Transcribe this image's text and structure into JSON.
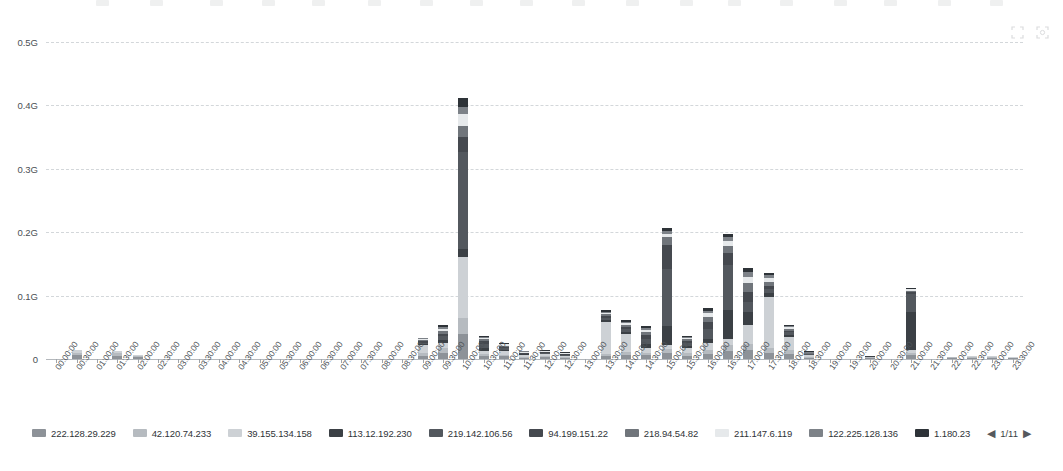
{
  "tools": [
    {
      "name": "restore-icon",
      "glyph": "restore"
    },
    {
      "name": "zoom-select-icon",
      "glyph": "zoom"
    }
  ],
  "legend": {
    "page_label": "1/11",
    "prev_label": "◀",
    "next_label": "▶",
    "items": [
      {
        "label": "222.128.29.229",
        "color": "#8d9298"
      },
      {
        "label": "42.120.74.233",
        "color": "#b6bbc0"
      },
      {
        "label": "39.155.134.158",
        "color": "#cdd1d5"
      },
      {
        "label": "113.12.192.230",
        "color": "#3b4045"
      },
      {
        "label": "219.142.106.56",
        "color": "#53585e"
      },
      {
        "label": "94.199.151.22",
        "color": "#45494f"
      },
      {
        "label": "218.94.54.82",
        "color": "#70757b"
      },
      {
        "label": "211.147.6.119",
        "color": "#e6e9eb"
      },
      {
        "label": "122.225.128.136",
        "color": "#7d8288"
      },
      {
        "label": "1.180.23",
        "color": "#2e3338"
      }
    ]
  },
  "top_strip": [
    {
      "label": "",
      "x": 96
    },
    {
      "label": "",
      "x": 150
    },
    {
      "label": "",
      "x": 210
    },
    {
      "label": "",
      "x": 262
    },
    {
      "label": "",
      "x": 312
    },
    {
      "label": "",
      "x": 368
    },
    {
      "label": "",
      "x": 420
    },
    {
      "label": "",
      "x": 470
    },
    {
      "label": "",
      "x": 520
    },
    {
      "label": "",
      "x": 572
    },
    {
      "label": "",
      "x": 626
    },
    {
      "label": "",
      "x": 680
    },
    {
      "label": "",
      "x": 728
    },
    {
      "label": "",
      "x": 780
    },
    {
      "label": "",
      "x": 834
    },
    {
      "label": "",
      "x": 884
    },
    {
      "label": "",
      "x": 938
    },
    {
      "label": "",
      "x": 990
    }
  ],
  "chart_data": {
    "type": "bar",
    "stacked": true,
    "title": "",
    "xlabel": "",
    "ylabel": "",
    "ylim": [
      0,
      0.5
    ],
    "yunit": "G",
    "grid": true,
    "legend_position": "bottom",
    "ytick_labels": [
      "0",
      "0.1G",
      "0.2G",
      "0.3G",
      "0.4G",
      "0.5G"
    ],
    "ytick_values": [
      0,
      0.1,
      0.2,
      0.3,
      0.4,
      0.5
    ],
    "categories": [
      "00:00:00",
      "00:30:00",
      "01:00:00",
      "01:30:00",
      "02:00:00",
      "02:30:00",
      "03:00:00",
      "03:30:00",
      "04:00:00",
      "04:30:00",
      "05:00:00",
      "05:30:00",
      "06:00:00",
      "06:30:00",
      "07:00:00",
      "07:30:00",
      "08:00:00",
      "08:30:00",
      "09:00:00",
      "09:30:00",
      "10:00:00",
      "10:30:00",
      "11:00:00",
      "11:30:00",
      "12:00:00",
      "12:30:00",
      "13:00:00",
      "13:30:00",
      "14:00:00",
      "14:30:00",
      "15:00:00",
      "15:30:00",
      "16:00:00",
      "16:30:00",
      "17:00:00",
      "17:30:00",
      "18:00:00",
      "18:30:00",
      "19:00:00",
      "19:30:00",
      "20:00:00",
      "20:30:00",
      "21:00:00",
      "21:30:00",
      "22:00:00",
      "22:30:00",
      "23:00:00",
      "23:30:00"
    ],
    "series": [
      {
        "name": "222.128.29.229",
        "color": "#8d9298",
        "values": [
          0,
          0.006,
          0,
          0.005,
          0.003,
          0,
          0,
          0,
          0,
          0,
          0,
          0,
          0,
          0,
          0,
          0,
          0,
          0,
          0.004,
          0.01,
          0.05,
          0.004,
          0.004,
          0.002,
          0.003,
          0.002,
          0,
          0.004,
          0.006,
          0.006,
          0.01,
          0.005,
          0.008,
          0.012,
          0.014,
          0.01,
          0.008,
          0.002,
          0,
          0,
          0.002,
          0,
          0.006,
          0,
          0.002,
          0.002,
          0.002,
          0.001
        ]
      },
      {
        "name": "42.120.74.233",
        "color": "#b6bbc0",
        "values": [
          0,
          0.004,
          0,
          0.004,
          0.002,
          0,
          0,
          0,
          0,
          0,
          0,
          0,
          0,
          0,
          0,
          0,
          0,
          0,
          0.006,
          0.008,
          0.03,
          0.004,
          0.003,
          0.002,
          0.002,
          0.001,
          0,
          0.004,
          0.005,
          0.004,
          0.006,
          0.004,
          0.006,
          0.01,
          0.01,
          0.008,
          0.006,
          0.002,
          0,
          0,
          0.001,
          0,
          0.004,
          0,
          0.001,
          0.001,
          0.001,
          0.001
        ]
      },
      {
        "name": "39.155.134.158",
        "color": "#cdd1d5",
        "values": [
          0,
          0.005,
          0,
          0.004,
          0.002,
          0,
          0,
          0,
          0,
          0,
          0,
          0,
          0,
          0,
          0,
          0,
          0,
          0,
          0.012,
          0.008,
          0.12,
          0.004,
          0.006,
          0.003,
          0.003,
          0.002,
          0,
          0.05,
          0.028,
          0.008,
          0.008,
          0.008,
          0.012,
          0.01,
          0.03,
          0.08,
          0.02,
          0.002,
          0,
          0,
          0.001,
          0,
          0.004,
          0,
          0.001,
          0.001,
          0.001,
          0.001
        ]
      },
      {
        "name": "113.12.192.230",
        "color": "#3b4045",
        "values": [
          0,
          0,
          0,
          0,
          0,
          0,
          0,
          0,
          0,
          0,
          0,
          0,
          0,
          0,
          0,
          0,
          0,
          0,
          0.002,
          0.004,
          0.016,
          0.006,
          0.002,
          0.001,
          0.001,
          0.001,
          0,
          0.003,
          0.004,
          0.006,
          0.03,
          0.004,
          0.006,
          0.046,
          0.02,
          0.006,
          0.004,
          0.001,
          0,
          0,
          0.001,
          0,
          0.06,
          0,
          0,
          0,
          0,
          0
        ]
      },
      {
        "name": "219.142.106.56",
        "color": "#53585e",
        "values": [
          0,
          0,
          0,
          0,
          0,
          0,
          0,
          0,
          0,
          0,
          0,
          0,
          0,
          0,
          0,
          0,
          0,
          0,
          0.002,
          0.006,
          0.19,
          0.006,
          0.002,
          0.001,
          0.001,
          0.001,
          0,
          0.004,
          0.004,
          0.008,
          0.095,
          0.004,
          0.016,
          0.07,
          0.016,
          0.006,
          0.004,
          0.001,
          0,
          0,
          0,
          0,
          0.028,
          0,
          0,
          0,
          0,
          0
        ]
      },
      {
        "name": "94.199.151.22",
        "color": "#45494f",
        "values": [
          0,
          0,
          0,
          0,
          0,
          0,
          0,
          0,
          0,
          0,
          0,
          0,
          0,
          0,
          0,
          0,
          0,
          0,
          0.002,
          0.004,
          0.03,
          0.004,
          0.002,
          0.001,
          0.001,
          0.001,
          0,
          0.003,
          0.004,
          0.006,
          0.04,
          0.003,
          0.01,
          0.02,
          0.016,
          0.006,
          0.003,
          0.001,
          0,
          0,
          0,
          0,
          0.004,
          0,
          0,
          0,
          0,
          0
        ]
      },
      {
        "name": "218.94.54.82",
        "color": "#70757b",
        "values": [
          0,
          0,
          0,
          0,
          0,
          0,
          0,
          0,
          0,
          0,
          0,
          0,
          0,
          0,
          0,
          0,
          0,
          0,
          0.002,
          0.004,
          0.02,
          0.003,
          0.002,
          0.001,
          0.001,
          0.001,
          0,
          0.003,
          0.003,
          0.004,
          0.012,
          0.003,
          0.008,
          0.01,
          0.014,
          0.006,
          0.003,
          0.001,
          0,
          0,
          0,
          0,
          0.002,
          0,
          0,
          0,
          0,
          0
        ]
      },
      {
        "name": "211.147.6.119",
        "color": "#e6e9eb",
        "values": [
          0,
          0,
          0,
          0,
          0,
          0,
          0,
          0,
          0,
          0,
          0,
          0,
          0,
          0,
          0,
          0,
          0,
          0,
          0.002,
          0.004,
          0.024,
          0.002,
          0.002,
          0.001,
          0.001,
          0.001,
          0,
          0.002,
          0.003,
          0.004,
          0.006,
          0.002,
          0.006,
          0.008,
          0.01,
          0.006,
          0.002,
          0.001,
          0,
          0,
          0,
          0,
          0.002,
          0,
          0,
          0,
          0,
          0
        ]
      },
      {
        "name": "122.225.128.136",
        "color": "#7d8288",
        "values": [
          0,
          0,
          0,
          0,
          0,
          0,
          0,
          0,
          0,
          0,
          0,
          0,
          0,
          0,
          0,
          0,
          0,
          0,
          0.001,
          0.003,
          0.014,
          0.002,
          0.001,
          0.001,
          0.001,
          0.001,
          0,
          0.002,
          0.002,
          0.003,
          0.005,
          0.002,
          0.004,
          0.006,
          0.008,
          0.004,
          0.002,
          0.001,
          0,
          0,
          0,
          0,
          0.001,
          0,
          0,
          0,
          0,
          0
        ]
      },
      {
        "name": "1.180.23",
        "color": "#2e3338",
        "values": [
          0,
          0,
          0,
          0,
          0,
          0,
          0,
          0,
          0,
          0,
          0,
          0,
          0,
          0,
          0,
          0,
          0,
          0,
          0.001,
          0.003,
          0.018,
          0.002,
          0.001,
          0.001,
          0.001,
          0.001,
          0,
          0.002,
          0.002,
          0.003,
          0.004,
          0.002,
          0.004,
          0.006,
          0.006,
          0.004,
          0.002,
          0.001,
          0,
          0,
          0,
          0,
          0.001,
          0,
          0,
          0,
          0,
          0
        ]
      }
    ],
    "totals": [
      0,
      0.015,
      0,
      0.013,
      0.007,
      0,
      0,
      0,
      0,
      0,
      0,
      0,
      0,
      0,
      0,
      0,
      0,
      0,
      0.034,
      0.054,
      0.412,
      0.037,
      0.025,
      0.013,
      0.014,
      0.011,
      0,
      0.077,
      0.061,
      0.052,
      0.206,
      0.037,
      0.08,
      0.198,
      0.144,
      0.136,
      0.054,
      0.012,
      0,
      0,
      0.005,
      0,
      0.112,
      0,
      0.005,
      0.004,
      0.004,
      0.003
    ]
  }
}
